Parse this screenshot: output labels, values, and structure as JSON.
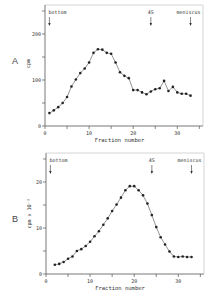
{
  "panels": [
    {
      "letter": "A",
      "ylabel": "cpm",
      "xlabel": "Fraction number",
      "markers": {
        "bottom": "bottom",
        "s4": "4S",
        "meniscus": "meniscus"
      },
      "yticks": [
        "0",
        "100",
        "200"
      ],
      "xticks": [
        "0",
        "10",
        "20",
        "30"
      ]
    },
    {
      "letter": "B",
      "ylabel": "cpm x 10⁻³",
      "xlabel": "Fraction number",
      "markers": {
        "bottom": "bottom",
        "s4": "4S",
        "meniscus": "meniscus"
      },
      "yticks": [
        "0",
        "10",
        "20"
      ],
      "xticks": [
        "0",
        "10",
        "20",
        "30"
      ]
    }
  ],
  "chart_data": [
    {
      "type": "line",
      "title": "A",
      "xlabel": "Fraction number",
      "ylabel": "cpm",
      "xlim": [
        0,
        35
      ],
      "ylim": [
        0,
        250
      ],
      "grid": false,
      "annotations": [
        {
          "text": "bottom",
          "x": 1
        },
        {
          "text": "4S",
          "x": 24
        },
        {
          "text": "meniscus",
          "x": 33
        }
      ],
      "x": [
        1,
        2,
        3,
        4,
        5,
        6,
        7,
        8,
        9,
        10,
        11,
        12,
        13,
        14,
        15,
        16,
        17,
        18,
        19,
        20,
        21,
        22,
        23,
        24,
        25,
        26,
        27,
        28,
        29,
        30,
        31,
        32,
        33
      ],
      "values": [
        28,
        34,
        41,
        50,
        63,
        86,
        101,
        115,
        125,
        138,
        159,
        167,
        166,
        159,
        157,
        138,
        117,
        109,
        104,
        78,
        78,
        73,
        69,
        75,
        80,
        82,
        98,
        76,
        85,
        73,
        70,
        70,
        66
      ]
    },
    {
      "type": "line",
      "title": "B",
      "xlabel": "Fraction number",
      "ylabel": "cpm x 10^-3",
      "xlim": [
        0,
        35
      ],
      "ylim": [
        0,
        25
      ],
      "grid": false,
      "annotations": [
        {
          "text": "bottom",
          "x": 1
        },
        {
          "text": "4S",
          "x": 24
        },
        {
          "text": "meniscus",
          "x": 33
        }
      ],
      "x": [
        2,
        3,
        4,
        5,
        6,
        7,
        8,
        9,
        10,
        11,
        12,
        13,
        14,
        15,
        16,
        17,
        18,
        19,
        20,
        21,
        22,
        23,
        24,
        25,
        26,
        27,
        28,
        29,
        30,
        31,
        32,
        33
      ],
      "values": [
        2.0,
        2.2,
        2.6,
        3.3,
        3.8,
        5.0,
        5.4,
        6.1,
        7.0,
        8.2,
        9.3,
        10.7,
        12.1,
        13.7,
        15.1,
        16.6,
        18.2,
        19.1,
        19.1,
        18.2,
        17.1,
        15.3,
        12.8,
        10.2,
        8.0,
        6.4,
        4.9,
        3.8,
        3.7,
        3.8,
        3.7,
        3.7
      ]
    }
  ]
}
